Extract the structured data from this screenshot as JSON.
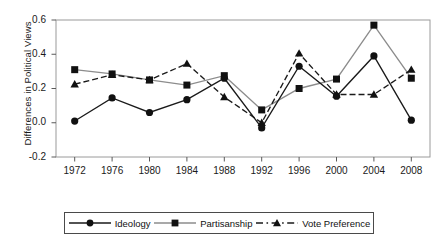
{
  "chart_data": {
    "type": "line",
    "title": "",
    "subtitle": "",
    "xlabel": "",
    "ylabel": "Differences in Political Views",
    "categories": [
      "1972",
      "1976",
      "1980",
      "1984",
      "1988",
      "1992",
      "1996",
      "2000",
      "2004",
      "2008"
    ],
    "x": [
      1972,
      1976,
      1980,
      1984,
      1988,
      1992,
      1996,
      2000,
      2004,
      2008
    ],
    "xlim": [
      1970,
      2010
    ],
    "ylim": [
      -0.2,
      0.6
    ],
    "yticks": [
      "0.6",
      "0.4",
      "0.2",
      "0.0",
      "-0.2"
    ],
    "ytick_values": [
      0.6,
      0.4,
      0.2,
      0.0,
      -0.2
    ],
    "grid": false,
    "legend_position": "bottom",
    "series": [
      {
        "name": "Ideology",
        "marker": "circle",
        "linestyle": "solid",
        "color": "#1a1a1a",
        "values": [
          0.01,
          0.145,
          0.06,
          0.135,
          0.26,
          -0.03,
          0.33,
          0.155,
          0.39,
          0.015
        ]
      },
      {
        "name": "Partisanship",
        "marker": "square",
        "linestyle": "solid",
        "color": "#8c8c8c",
        "values": [
          0.31,
          0.285,
          0.25,
          0.22,
          0.275,
          0.075,
          0.2,
          0.255,
          0.57,
          0.26
        ]
      },
      {
        "name": "Vote Preference",
        "marker": "triangle",
        "linestyle": "dashed",
        "color": "#1a1a1a",
        "values": [
          0.225,
          0.28,
          0.25,
          0.345,
          0.15,
          0.0,
          0.405,
          0.165,
          0.165,
          0.31
        ]
      }
    ]
  },
  "legend": {
    "items": [
      {
        "label": "Ideology"
      },
      {
        "label": "Partisanship"
      },
      {
        "label": "Vote Preference"
      }
    ]
  }
}
